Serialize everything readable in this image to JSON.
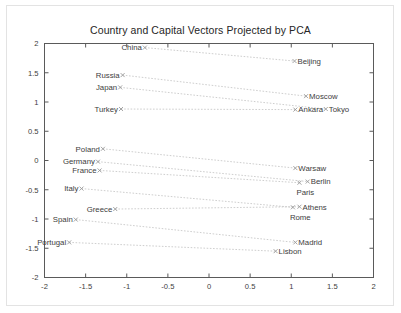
{
  "chart_data": {
    "type": "scatter",
    "title": "Country and Capital Vectors Projected by PCA",
    "xlabel": "",
    "ylabel": "",
    "xlim": [
      -2,
      2
    ],
    "ylim": [
      -2,
      2
    ],
    "xticks": [
      "-2",
      "-1.5",
      "-1",
      "-0.5",
      "0",
      "0.5",
      "1",
      "1.5",
      "2"
    ],
    "xtick_values": [
      -2,
      -1.5,
      -1,
      -0.5,
      0,
      0.5,
      1,
      1.5,
      2
    ],
    "yticks": [
      "2",
      "1.5",
      "1",
      "0.5",
      "0",
      "-0.5",
      "-1",
      "-1.5",
      "-2"
    ],
    "ytick_values": [
      2,
      1.5,
      1,
      0.5,
      0,
      -0.5,
      -1,
      -1.5,
      -2
    ],
    "grid": false,
    "legend": "none",
    "marker": "x",
    "connector_style": "dotted",
    "pairs": [
      {
        "country": "China",
        "country_xy": [
          -0.78,
          1.93
        ],
        "capital": "Beijing",
        "capital_xy": [
          1.04,
          1.7
        ]
      },
      {
        "country": "Russia",
        "country_xy": [
          -1.05,
          1.46
        ],
        "capital": "Moscow",
        "capital_xy": [
          1.18,
          1.1
        ]
      },
      {
        "country": "Japan",
        "country_xy": [
          -1.08,
          1.25
        ],
        "capital": "Tokyo",
        "capital_xy": [
          1.42,
          0.88
        ]
      },
      {
        "country": "Turkey",
        "country_xy": [
          -1.07,
          0.88
        ],
        "capital": "Ankara",
        "capital_xy": [
          1.05,
          0.87
        ]
      },
      {
        "country": "Poland",
        "country_xy": [
          -1.29,
          0.2
        ],
        "capital": "Warsaw",
        "capital_xy": [
          1.05,
          -0.13
        ]
      },
      {
        "country": "Germany",
        "country_xy": [
          -1.35,
          -0.02
        ],
        "capital": "Berlin",
        "capital_xy": [
          1.2,
          -0.36
        ]
      },
      {
        "country": "France",
        "country_xy": [
          -1.33,
          -0.17
        ],
        "capital": "Paris",
        "capital_xy": [
          1.1,
          -0.38
        ]
      },
      {
        "country": "Italy",
        "country_xy": [
          -1.55,
          -0.48
        ],
        "capital": "Rome",
        "capital_xy": [
          1.02,
          -0.8
        ]
      },
      {
        "country": "Greece",
        "country_xy": [
          -1.14,
          -0.83
        ],
        "capital": "Athens",
        "capital_xy": [
          1.1,
          -0.79
        ]
      },
      {
        "country": "Spain",
        "country_xy": [
          -1.62,
          -1.01
        ],
        "capital": "Madrid",
        "capital_xy": [
          1.05,
          -1.4
        ]
      },
      {
        "country": "Portugal",
        "country_xy": [
          -1.7,
          -1.4
        ],
        "capital": "Lisbon",
        "capital_xy": [
          0.81,
          -1.55
        ]
      }
    ]
  },
  "colors": {
    "background": "#ffffff",
    "outer_border": "#e3e3e3",
    "axis": "#5a5a5a",
    "text": "#3d3d3d",
    "title": "#262626",
    "connector": "#b9b9b9",
    "marker": "#9a9a9a"
  }
}
